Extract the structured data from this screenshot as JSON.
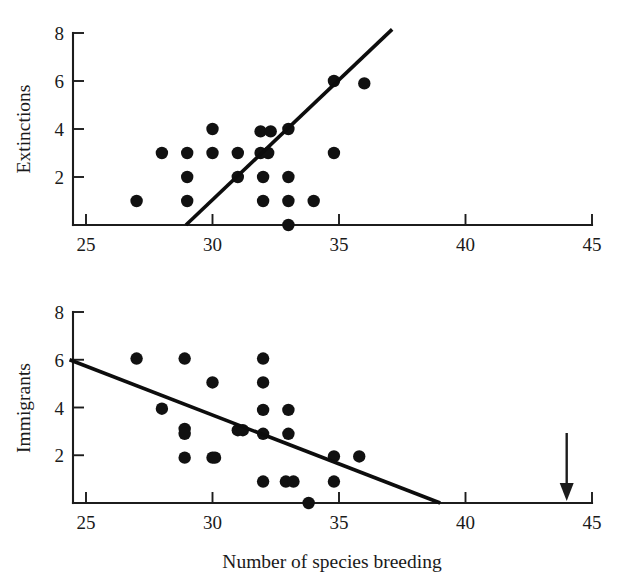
{
  "figure": {
    "xlabel": "Number of species breeding",
    "annotation_arrow": "downward-arrow-marker"
  },
  "chart_data": [
    {
      "type": "scatter",
      "panel": "top",
      "title": "",
      "ylabel": "Extinctions",
      "xlabel": "",
      "xlim": [
        24.3,
        45
      ],
      "ylim": [
        0,
        8
      ],
      "xticks": [
        25,
        30,
        35,
        40,
        45
      ],
      "yticks": [
        2,
        4,
        6,
        8
      ],
      "grid": false,
      "legend": "none",
      "points": [
        {
          "x": 27.0,
          "y": 1
        },
        {
          "x": 28.0,
          "y": 3
        },
        {
          "x": 29.0,
          "y": 3
        },
        {
          "x": 29.0,
          "y": 2
        },
        {
          "x": 29.0,
          "y": 1
        },
        {
          "x": 30.0,
          "y": 4
        },
        {
          "x": 30.0,
          "y": 3
        },
        {
          "x": 31.0,
          "y": 3
        },
        {
          "x": 31.0,
          "y": 2
        },
        {
          "x": 31.9,
          "y": 3.9
        },
        {
          "x": 31.9,
          "y": 3
        },
        {
          "x": 32.2,
          "y": 3
        },
        {
          "x": 32.3,
          "y": 3.9
        },
        {
          "x": 32.0,
          "y": 2
        },
        {
          "x": 32.0,
          "y": 1
        },
        {
          "x": 33.0,
          "y": 4
        },
        {
          "x": 33.0,
          "y": 2
        },
        {
          "x": 33.0,
          "y": 1
        },
        {
          "x": 33.0,
          "y": 0
        },
        {
          "x": 34.0,
          "y": 1
        },
        {
          "x": 34.8,
          "y": 6
        },
        {
          "x": 34.8,
          "y": 3
        },
        {
          "x": 36.0,
          "y": 5.9
        }
      ],
      "fit_line": {
        "x1": 28.95,
        "y1": 0,
        "x2": 37.1,
        "y2": 8.15
      }
    },
    {
      "type": "scatter",
      "panel": "bottom",
      "title": "",
      "ylabel": "Immigrants",
      "xlabel": "Number of species breeding",
      "xlim": [
        24.3,
        45
      ],
      "ylim": [
        0,
        8
      ],
      "xticks": [
        25,
        30,
        35,
        40,
        45
      ],
      "yticks": [
        2,
        4,
        6,
        8
      ],
      "grid": false,
      "legend": "none",
      "points": [
        {
          "x": 27.0,
          "y": 6.05
        },
        {
          "x": 28.0,
          "y": 3.95
        },
        {
          "x": 28.9,
          "y": 6.05
        },
        {
          "x": 28.9,
          "y": 3.1
        },
        {
          "x": 28.9,
          "y": 2.9
        },
        {
          "x": 28.9,
          "y": 1.9
        },
        {
          "x": 30.0,
          "y": 5.05
        },
        {
          "x": 30.0,
          "y": 1.9
        },
        {
          "x": 30.1,
          "y": 1.9
        },
        {
          "x": 31.0,
          "y": 3.05
        },
        {
          "x": 31.2,
          "y": 3.05
        },
        {
          "x": 32.0,
          "y": 6.05
        },
        {
          "x": 32.0,
          "y": 5.05
        },
        {
          "x": 32.0,
          "y": 3.9
        },
        {
          "x": 32.0,
          "y": 2.9
        },
        {
          "x": 32.0,
          "y": 0.9
        },
        {
          "x": 33.0,
          "y": 3.9
        },
        {
          "x": 33.0,
          "y": 2.9
        },
        {
          "x": 32.9,
          "y": 0.9
        },
        {
          "x": 33.2,
          "y": 0.9
        },
        {
          "x": 33.8,
          "y": 0
        },
        {
          "x": 34.8,
          "y": 1.95
        },
        {
          "x": 34.8,
          "y": 0.9
        },
        {
          "x": 35.8,
          "y": 1.95
        }
      ],
      "fit_line": {
        "x1": 24.35,
        "y1": 6.0,
        "x2": 39.0,
        "y2": 0
      },
      "annotation": {
        "type": "arrow",
        "x": 44.0,
        "direction": "down",
        "label": ""
      }
    }
  ]
}
